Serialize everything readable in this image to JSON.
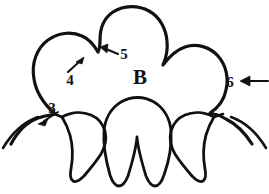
{
  "figure": {
    "title": "B",
    "ink_color": "#111111",
    "background_color": "#ffffff",
    "width": 269,
    "height": 194
  },
  "main_label": {
    "text": "B",
    "x": 140,
    "y": 82
  },
  "callouts": [
    {
      "number": "3",
      "label_x": 52,
      "label_y": 113,
      "arrow_from_x": 58,
      "arrow_from_y": 112,
      "arrow_to_x": 38,
      "arrow_to_y": 124,
      "direction": "down-left"
    },
    {
      "number": "4",
      "label_x": 70,
      "label_y": 80,
      "arrow_from_x": 68,
      "arrow_from_y": 72,
      "arrow_to_x": 83,
      "arrow_to_y": 58,
      "direction": "up-right"
    },
    {
      "number": "5",
      "label_x": 124,
      "label_y": 57,
      "arrow_from_x": 120,
      "arrow_from_y": 55,
      "arrow_to_x": 101,
      "arrow_to_y": 48,
      "direction": "up-left"
    },
    {
      "number": "6",
      "label_x": 230,
      "label_y": 86,
      "arrow_from_x": 268,
      "arrow_from_y": 81,
      "arrow_to_x": 241,
      "arrow_to_y": 81,
      "direction": "left"
    }
  ],
  "caption": {
    "text": ""
  },
  "strokes": {
    "outer_outline": "M 11 144 C 18 131 27 122 38 118 C 44 116 50 115 55 114 C 45 105 36 92 34 79 C 31 63 37 48 48 40 C 58 33 71 31 82 36 C 89 39 94 45 98 52 C 100 48 100 44 100 40 C 100 28 104 18 113 12 C 124 5 138 5 149 11 C 160 17 166 29 167 41 C 168 50 166 58 163 65 C 169 57 176 50 185 47 C 197 43 210 47 218 56 C 226 65 229 78 226 90 C 224 100 218 108 210 113 C 216 114 221 116 226 119 C 236 124 245 133 252 144",
    "left_inner_petal": "M 62 117 C 71 112 82 111 91 115 C 98 118 103 124 105 131 C 107 139 105 147 101 154 C 96 162 90 169 84 176 C 80 180 76 183 73 181 C 70 179 70 174 71 169 C 73 158 73 146 70 135 C 68 128 65 122 62 117",
    "center_inner_petal": "M 104 131 C 105 119 111 108 121 102 C 131 96 144 96 154 102 C 164 108 170 119 171 131 C 172 146 169 161 164 175 C 162 181 159 186 155 186 C 151 186 148 181 146 176 C 142 163 138 150 137 137 C 136 150 132 163 128 176 C 126 181 123 186 119 186 C 115 186 112 181 110 175 C 106 161 103 146 104 131",
    "right_inner_petal": "M 171 131 C 173 124 178 118 185 115 C 194 111 205 112 214 117 C 211 122 208 128 206 135 C 203 146 203 158 205 169 C 206 174 206 179 203 181 C 200 183 196 180 192 176 C 186 169 180 162 175 154 C 171 147 169 139 171 131",
    "left_base_arc": "M 3 148 C 12 133 24 122 38 117",
    "right_base_arc": "M 266 148 C 257 133 245 122 231 117",
    "left_lobe_join": "M 55 114 C 57 115 59 116 62 117",
    "right_lobe_join": "M 214 117 C 217 116 220 115 223 114"
  }
}
